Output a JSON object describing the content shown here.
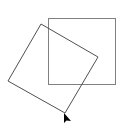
{
  "canvas": {
    "width": 121,
    "height": 140,
    "background": "#ffffff"
  },
  "shapes": {
    "square": {
      "x": 48,
      "y": 18,
      "width": 67,
      "height": 66,
      "stroke": "#808080",
      "stroke_width": 1
    },
    "rotated_square": {
      "points": "41,24 98,57 65,113 8,81",
      "stroke": "#505050",
      "stroke_width": 1
    }
  },
  "cursor": {
    "x": 64,
    "y": 113,
    "color": "#000000"
  }
}
